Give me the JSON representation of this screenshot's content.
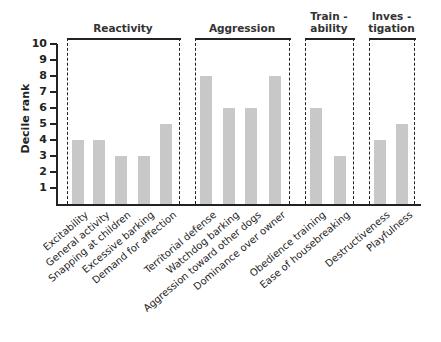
{
  "chart_data": {
    "type": "bar",
    "title": "",
    "xlabel": "",
    "ylabel": "Decile rank",
    "ylim": [
      0,
      10
    ],
    "yticks": [
      1,
      2,
      3,
      4,
      5,
      6,
      7,
      8,
      9,
      10
    ],
    "grid": false,
    "categories": [
      "Excitability",
      "General activity",
      "Snapping at children",
      "Excessive barking",
      "Demand for affection",
      "Territorial defense",
      "Watchdog barking",
      "Aggression toward other dogs",
      "Dominance over owner",
      "Obedience training",
      "Ease of housebreaking",
      "Destructiveness",
      "Playfulness"
    ],
    "values": [
      4,
      4,
      3,
      3,
      5,
      8,
      6,
      6,
      8,
      6,
      3,
      4,
      5
    ],
    "groups": [
      {
        "name": "Reactivity",
        "title_lines": [
          "Reactivity"
        ],
        "categories": [
          "Excitability",
          "General activity",
          "Snapping at children",
          "Excessive barking",
          "Demand for affection"
        ]
      },
      {
        "name": "Aggression",
        "title_lines": [
          "Aggression"
        ],
        "categories": [
          "Territorial defense",
          "Watchdog barking",
          "Aggression toward other dogs",
          "Dominance over owner"
        ]
      },
      {
        "name": "Trainability",
        "title_lines": [
          "Train -",
          "ability"
        ],
        "categories": [
          "Obedience training",
          "Ease of housebreaking"
        ]
      },
      {
        "name": "Investigation",
        "title_lines": [
          "Inves -",
          "tigation"
        ],
        "categories": [
          "Destructiveness",
          "Playfulness"
        ]
      }
    ],
    "bar_color": "#c8c8c8"
  },
  "layout": {
    "baseline_y": 204,
    "unit_px": 16,
    "bar_width": 12,
    "bar_x": [
      72,
      93,
      115,
      138,
      160,
      200,
      223,
      245,
      269,
      310,
      334,
      374,
      396
    ],
    "boxes": [
      {
        "left": 67,
        "right": 179
      },
      {
        "left": 195,
        "right": 289
      },
      {
        "left": 305,
        "right": 353
      },
      {
        "left": 369,
        "right": 414
      }
    ],
    "box_top": 38
  }
}
